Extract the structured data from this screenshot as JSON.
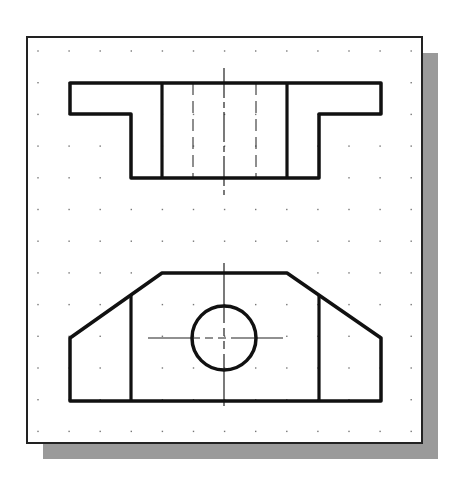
{
  "drawing": {
    "title": "Two-view orthographic drawing",
    "colors": {
      "background": "#ffffff",
      "frame": "#222222",
      "shadow": "#9a9a9a",
      "object_line": "#111111",
      "center_line": "#222222",
      "hidden_line": "#444444",
      "grid_dot": "#777777"
    },
    "frame": {
      "x": 27,
      "y": 37,
      "width": 395,
      "height": 406,
      "shadow_offset": 16
    },
    "grid": {
      "x0": 38,
      "y0": 51,
      "spacing_x": 31.1,
      "spacing_y": 31.7,
      "cols": 13,
      "rows": 13
    },
    "top_view": {
      "outline": [
        [
          70,
          83
        ],
        [
          381,
          83
        ],
        [
          381,
          114
        ],
        [
          319,
          114
        ],
        [
          319,
          178
        ],
        [
          131,
          178
        ],
        [
          131,
          114
        ],
        [
          70,
          114
        ]
      ],
      "visible_lines": [
        [
          [
            162,
            83
          ],
          [
            162,
            178
          ]
        ],
        [
          [
            287,
            83
          ],
          [
            287,
            178
          ]
        ]
      ],
      "hidden_lines": [
        [
          [
            193,
            83
          ],
          [
            193,
            178
          ]
        ],
        [
          [
            256,
            83
          ],
          [
            256,
            178
          ]
        ]
      ],
      "center_line": [
        [
          224,
          68
        ],
        [
          224,
          195
        ]
      ]
    },
    "front_view": {
      "outline": [
        [
          162,
          273
        ],
        [
          287,
          273
        ],
        [
          381,
          338
        ],
        [
          381,
          401
        ],
        [
          70,
          401
        ],
        [
          70,
          338
        ]
      ],
      "visible_lines": [
        [
          [
            131,
            295
          ],
          [
            131,
            401
          ]
        ],
        [
          [
            319,
            295
          ],
          [
            319,
            401
          ]
        ]
      ],
      "hole": {
        "cx": 224,
        "cy": 338,
        "r": 32
      },
      "center_lines": {
        "horizontal": [
          [
            148,
            338
          ],
          [
            308,
            338
          ]
        ],
        "vertical": [
          [
            224,
            263
          ],
          [
            224,
            406
          ]
        ]
      }
    }
  }
}
